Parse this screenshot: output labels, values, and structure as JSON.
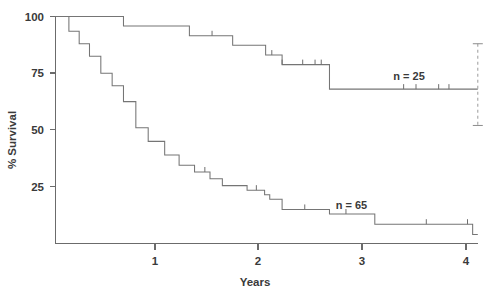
{
  "chart_data": {
    "type": "line",
    "subtype": "kaplan-meier-survival",
    "title": "",
    "xlabel": "Years",
    "ylabel": "% Survival",
    "xlim": [
      0,
      4.12
    ],
    "ylim": [
      0,
      100
    ],
    "xticks": [
      1,
      2,
      3,
      4
    ],
    "xtick_labels": [
      "1",
      "2",
      "3",
      "4"
    ],
    "yticks": [
      25,
      50,
      75,
      100
    ],
    "ytick_labels": [
      "25",
      "50",
      "75",
      "100"
    ],
    "grid": false,
    "legend_position": "inline-annotation",
    "series": [
      {
        "name": "n = 25",
        "label": "n = 25",
        "label_x": 3.28,
        "label_y": 72,
        "steps": [
          [
            0.0,
            100
          ],
          [
            0.08,
            100
          ],
          [
            0.08,
            100
          ],
          [
            0.66,
            100
          ],
          [
            0.66,
            95.8
          ],
          [
            1.3,
            95.8
          ],
          [
            1.3,
            91.5
          ],
          [
            1.72,
            91.5
          ],
          [
            1.72,
            87.3
          ],
          [
            2.04,
            87.3
          ],
          [
            2.04,
            83.0
          ],
          [
            2.2,
            83.0
          ],
          [
            2.2,
            78.8
          ],
          [
            2.66,
            78.8
          ],
          [
            2.66,
            68.0
          ],
          [
            4.1,
            68.0
          ]
        ],
        "censor_marks": [
          1.52,
          2.1,
          2.2,
          2.4,
          2.52,
          2.58,
          3.38,
          3.5,
          3.72,
          3.82
        ],
        "error_bar": {
          "x": 4.1,
          "value": 68.0,
          "lower": 52.0,
          "upper": 88.0,
          "style": "dashed"
        }
      },
      {
        "name": "n = 65",
        "label": "n = 65",
        "label_x": 2.72,
        "label_y": 15,
        "steps": [
          [
            0.0,
            100
          ],
          [
            0.13,
            100
          ],
          [
            0.13,
            93.5
          ],
          [
            0.23,
            93.5
          ],
          [
            0.23,
            88.0
          ],
          [
            0.33,
            88.0
          ],
          [
            0.33,
            82.5
          ],
          [
            0.44,
            82.5
          ],
          [
            0.44,
            75.0
          ],
          [
            0.55,
            75.0
          ],
          [
            0.55,
            69.5
          ],
          [
            0.66,
            69.5
          ],
          [
            0.66,
            62.5
          ],
          [
            0.78,
            62.5
          ],
          [
            0.78,
            51.0
          ],
          [
            0.9,
            51.0
          ],
          [
            0.9,
            45.0
          ],
          [
            1.06,
            45.0
          ],
          [
            1.06,
            39.0
          ],
          [
            1.2,
            39.0
          ],
          [
            1.2,
            34.5
          ],
          [
            1.35,
            34.5
          ],
          [
            1.35,
            31.5
          ],
          [
            1.5,
            31.5
          ],
          [
            1.5,
            28.5
          ],
          [
            1.62,
            28.5
          ],
          [
            1.62,
            25.5
          ],
          [
            1.86,
            25.5
          ],
          [
            1.86,
            23.5
          ],
          [
            2.03,
            23.5
          ],
          [
            2.03,
            21.5
          ],
          [
            2.08,
            21.5
          ],
          [
            2.08,
            19.5
          ],
          [
            2.2,
            19.5
          ],
          [
            2.2,
            15.0
          ],
          [
            2.66,
            15.0
          ],
          [
            2.66,
            13.0
          ],
          [
            3.1,
            13.0
          ],
          [
            3.1,
            8.5
          ],
          [
            4.05,
            8.5
          ],
          [
            4.05,
            4.0
          ],
          [
            4.1,
            4.0
          ]
        ],
        "censor_marks": [
          1.45,
          1.95,
          2.42,
          2.82,
          3.6,
          4.0
        ],
        "error_bar": null
      }
    ]
  },
  "axes": {
    "x_axis_name": "years-axis",
    "y_axis_name": "percent-survival-axis"
  }
}
